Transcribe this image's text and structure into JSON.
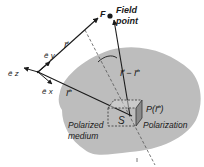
{
  "diagram": {
    "labels": {
      "field_point_line1": "Field",
      "field_point_line2": "point",
      "field_point_marker": "F",
      "r_vector_top": "r⃗",
      "r_vector_bottom": "r⃗'",
      "r_minus_r_prime": "r⃗ − r⃗'",
      "unit_z": "ê z",
      "unit_y": "ê y",
      "unit_x": "ê x",
      "volume_element": "S",
      "polarization_vector": "P(r⃗')",
      "polarization_label": "Polarization",
      "medium_line1": "Polarized",
      "medium_line2": "medium"
    },
    "colors": {
      "medium_fill": "#bdbdbd",
      "medium_fill_dark": "#a8a8a8",
      "line": "#1a1a1a",
      "dashed": "#555555",
      "prism_front": "#d8d8d8",
      "prism_side": "#8a8a8a"
    }
  }
}
